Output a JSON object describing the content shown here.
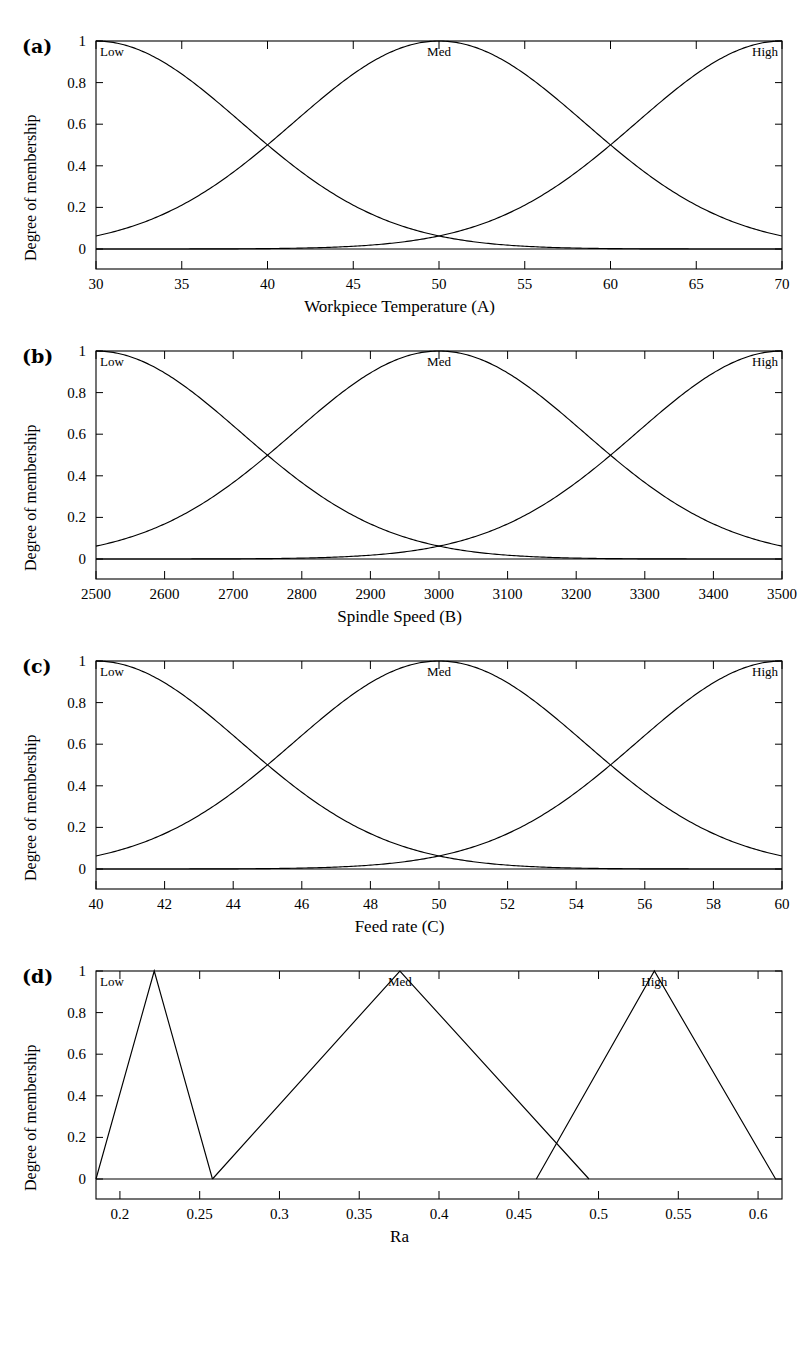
{
  "figure": {
    "y_axis_label": "Degree of membership",
    "y_ticks": [
      "0",
      "0.2",
      "0.4",
      "0.6",
      "0.8",
      "1"
    ],
    "y_tick_values": [
      0,
      0.2,
      0.4,
      0.6,
      0.8,
      1
    ],
    "set_labels": {
      "low": "Low",
      "med": "Med",
      "high": "High"
    }
  },
  "panels": [
    {
      "tag": "(a)",
      "xlabel": "Workpiece Temperature (A)",
      "xticks": [
        "30",
        "35",
        "40",
        "45",
        "50",
        "55",
        "60",
        "65",
        "70"
      ],
      "xtick_values": [
        30,
        35,
        40,
        45,
        50,
        55,
        60,
        65,
        70
      ]
    },
    {
      "tag": "(b)",
      "xlabel": "Spindle Speed (B)",
      "xticks": [
        "2500",
        "2600",
        "2700",
        "2800",
        "2900",
        "3000",
        "3100",
        "3200",
        "3300",
        "3400",
        "3500"
      ],
      "xtick_values": [
        2500,
        2600,
        2700,
        2800,
        2900,
        3000,
        3100,
        3200,
        3300,
        3400,
        3500
      ]
    },
    {
      "tag": "(c)",
      "xlabel": "Feed rate (C)",
      "xticks": [
        "40",
        "42",
        "44",
        "46",
        "48",
        "50",
        "52",
        "54",
        "56",
        "58",
        "60"
      ],
      "xtick_values": [
        40,
        42,
        44,
        46,
        48,
        50,
        52,
        54,
        56,
        58,
        60
      ]
    },
    {
      "tag": "(d)",
      "xlabel": "Ra",
      "xticks": [
        "0.2",
        "0.25",
        "0.3",
        "0.35",
        "0.4",
        "0.45",
        "0.5",
        "0.55",
        "0.6"
      ],
      "xtick_values": [
        0.2,
        0.25,
        0.3,
        0.35,
        0.4,
        0.45,
        0.5,
        0.55,
        0.6
      ]
    }
  ],
  "chart_data": [
    {
      "type": "line",
      "title": "(a) Workpiece Temperature membership functions",
      "xlabel": "Workpiece Temperature (A)",
      "ylabel": "Degree of membership",
      "xlim": [
        30,
        70
      ],
      "ylim": [
        0,
        1
      ],
      "grid": false,
      "legend": "inside-top",
      "membership": "gaussian",
      "series": [
        {
          "name": "Low",
          "mean": 30,
          "sigma": 8.5,
          "peak": 1.0,
          "label_x": 31,
          "label_y": 1.0
        },
        {
          "name": "Med",
          "mean": 50,
          "sigma": 8.5,
          "peak": 1.0,
          "label_x": 50,
          "label_y": 1.0
        },
        {
          "name": "High",
          "mean": 70,
          "sigma": 8.5,
          "peak": 1.0,
          "label_x": 69,
          "label_y": 1.0
        }
      ],
      "crossings": [
        {
          "x": 40,
          "y": 0.5
        },
        {
          "x": 50,
          "y": 0.08
        },
        {
          "x": 60,
          "y": 0.5
        }
      ]
    },
    {
      "type": "line",
      "title": "(b) Spindle Speed membership functions",
      "xlabel": "Spindle Speed (B)",
      "ylabel": "Degree of membership",
      "xlim": [
        2500,
        3500
      ],
      "ylim": [
        0,
        1
      ],
      "grid": false,
      "legend": "inside-top",
      "membership": "gaussian",
      "series": [
        {
          "name": "Low",
          "mean": 2500,
          "sigma": 212,
          "peak": 1.0,
          "label_x": 2525,
          "label_y": 1.0
        },
        {
          "name": "Med",
          "mean": 3000,
          "sigma": 212,
          "peak": 1.0,
          "label_x": 3000,
          "label_y": 1.0
        },
        {
          "name": "High",
          "mean": 3500,
          "sigma": 212,
          "peak": 1.0,
          "label_x": 3475,
          "label_y": 1.0
        }
      ],
      "crossings": [
        {
          "x": 2745,
          "y": 0.5
        },
        {
          "x": 3000,
          "y": 0.08
        },
        {
          "x": 3250,
          "y": 0.5
        }
      ]
    },
    {
      "type": "line",
      "title": "(c) Feed rate membership functions",
      "xlabel": "Feed rate (C)",
      "ylabel": "Degree of membership",
      "xlim": [
        40,
        60
      ],
      "ylim": [
        0,
        1
      ],
      "grid": false,
      "legend": "inside-top",
      "membership": "gaussian",
      "series": [
        {
          "name": "Low",
          "mean": 40,
          "sigma": 4.25,
          "peak": 1.0,
          "label_x": 40.5,
          "label_y": 1.0
        },
        {
          "name": "Med",
          "mean": 50,
          "sigma": 4.25,
          "peak": 1.0,
          "label_x": 50,
          "label_y": 1.0
        },
        {
          "name": "High",
          "mean": 60,
          "sigma": 4.25,
          "peak": 1.0,
          "label_x": 59.5,
          "label_y": 1.0
        }
      ],
      "crossings": [
        {
          "x": 45,
          "y": 0.5
        },
        {
          "x": 50,
          "y": 0.08
        },
        {
          "x": 55,
          "y": 0.5
        }
      ]
    },
    {
      "type": "line",
      "title": "(d) Ra membership functions",
      "xlabel": "Ra",
      "ylabel": "Degree of membership",
      "xlim": [
        0.185,
        0.615
      ],
      "ylim": [
        0,
        1
      ],
      "grid": false,
      "legend": "inside-top",
      "membership": "triangular",
      "series": [
        {
          "name": "Low",
          "points": [
            [
              0.185,
              0.0
            ],
            [
              0.2215,
              1.0
            ],
            [
              0.258,
              0.0
            ]
          ],
          "label_x": 0.2215,
          "label_y": 1.0
        },
        {
          "name": "Med",
          "points": [
            [
              0.258,
              0.0
            ],
            [
              0.3755,
              1.0
            ],
            [
              0.494,
              0.0
            ]
          ],
          "label_x": 0.3755,
          "label_y": 1.0
        },
        {
          "name": "High",
          "points": [
            [
              0.461,
              0.0
            ],
            [
              0.535,
              1.0
            ],
            [
              0.611,
              0.0
            ]
          ],
          "label_x": 0.535,
          "label_y": 1.0
        }
      ],
      "crossings": [
        {
          "x": 0.478,
          "y": 0.2
        }
      ]
    }
  ]
}
